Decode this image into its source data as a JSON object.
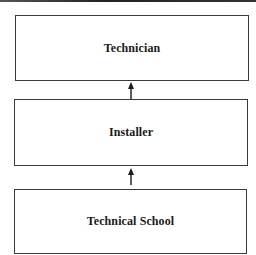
{
  "diagram": {
    "type": "vertical-flow",
    "direction": "bottom-to-top",
    "nodes": [
      {
        "id": "technician",
        "label": "Technician"
      },
      {
        "id": "installer",
        "label": "Installer"
      },
      {
        "id": "technical-school",
        "label": "Technical School"
      }
    ],
    "edges": [
      {
        "from": "technical-school",
        "to": "installer"
      },
      {
        "from": "installer",
        "to": "technician"
      }
    ]
  },
  "colors": {
    "border": "#3a3a3a",
    "text": "#1a1a1a",
    "background": "#ffffff"
  }
}
